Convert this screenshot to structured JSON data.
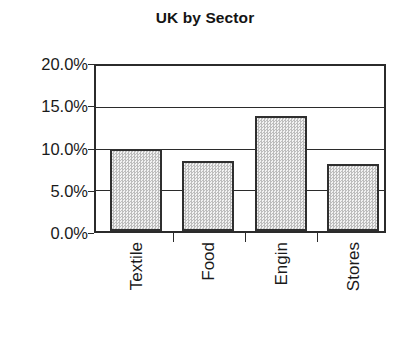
{
  "chart_data": {
    "type": "bar",
    "title": "UK by Sector",
    "xlabel": "",
    "ylabel": "",
    "categories": [
      "Textile",
      "Food",
      "Engin",
      "Stores"
    ],
    "values": [
      10.0,
      8.5,
      14.0,
      8.1
    ],
    "value_labels": [
      "10.0%",
      "8.5%",
      "14.0%",
      "8.1%"
    ],
    "ylim": [
      0,
      20
    ],
    "ytick_values": [
      0,
      5,
      10,
      15,
      20
    ],
    "ytick_labels": [
      "0.0%",
      "5.0%",
      "10.0%",
      "15.0%",
      "20.0%"
    ],
    "grid": "horizontal",
    "legend": "none",
    "series": [
      {
        "name": "UK by Sector",
        "values": [
          10.0,
          8.5,
          14.0,
          8.1
        ]
      }
    ],
    "style": {
      "bar_fill": "#dcdcdc",
      "bar_edge": "#2f2f2f",
      "grid_color": "#2b2b2b",
      "frame_color": "#2b2b2b",
      "text_color": "#1a1a1a",
      "background": "#ffffff"
    }
  }
}
